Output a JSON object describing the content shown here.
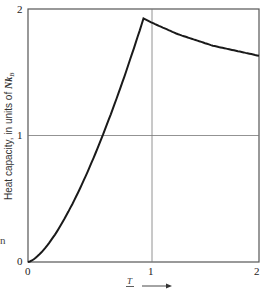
{
  "chart_data": {
    "type": "line",
    "title": "",
    "xlabel": "T / Tc",
    "ylabel": "Heat capacity, in units of NkB",
    "xlim": [
      0,
      2
    ],
    "ylim": [
      0,
      2
    ],
    "x_ticks": [
      "0",
      "1",
      "2"
    ],
    "y_ticks": [
      "0",
      "1",
      "2"
    ],
    "grid": {
      "x": [
        1
      ],
      "y": [
        1
      ]
    },
    "legend": null,
    "series": [
      {
        "name": "Heat capacity",
        "x": [
          0,
          0.1,
          0.2,
          0.3,
          0.4,
          0.5,
          0.6,
          0.7,
          0.8,
          0.9,
          1.0,
          1.1,
          1.2,
          1.3,
          1.4,
          1.5,
          1.6,
          1.7,
          1.8,
          1.9,
          2.0
        ],
        "values": [
          0,
          0.06,
          0.17,
          0.32,
          0.49,
          0.68,
          0.89,
          1.13,
          1.38,
          1.64,
          1.925,
          1.88,
          1.84,
          1.8,
          1.77,
          1.74,
          1.71,
          1.69,
          1.67,
          1.65,
          1.63
        ]
      }
    ],
    "annotations": [
      "arrow pointing right next to x-axis label"
    ]
  },
  "labels": {
    "y_axis": "Heat capacity, in units of ",
    "y_axis_unit": "Nk",
    "y_axis_sub": "B",
    "x_axis_num": "T",
    "x_axis_den": "—",
    "x0": "0",
    "x1": "1",
    "x2": "2",
    "y0": "0",
    "y1": "1",
    "y2": "2",
    "stray_text": "n"
  },
  "colors": {
    "curve": "#1a1a1a",
    "axes": "#555555",
    "grid": "#777777"
  }
}
